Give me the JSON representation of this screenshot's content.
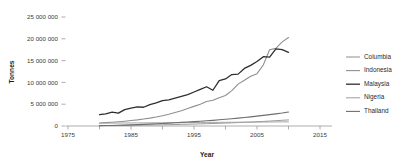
{
  "chart_data": {
    "type": "line",
    "title": "",
    "xlabel": "Year",
    "ylabel": "Tonnes",
    "xlim": [
      1975,
      2015
    ],
    "ylim": [
      0,
      25000000
    ],
    "grid": false,
    "legend_position": "right",
    "x_ticks": [
      "1975",
      "1980",
      "1985",
      "1990",
      "1995",
      "2000",
      "2005",
      "2010",
      "2015"
    ],
    "x_tick_values": [
      1975,
      1980,
      1985,
      1990,
      1995,
      2000,
      2005,
      2010,
      2015
    ],
    "x_tick_labels_shown": [
      "1975",
      "1980",
      "1985",
      "1990",
      "1995",
      "2000",
      "2005",
      "2010",
      "2015"
    ],
    "y_ticks": [
      "0",
      "5 000 000",
      "10 000 000",
      "15 000 000",
      "20 000 000",
      "25 000 000"
    ],
    "y_tick_values": [
      0,
      5000000,
      10000000,
      15000000,
      20000000,
      25000000
    ],
    "x": [
      1980,
      1981,
      1982,
      1983,
      1984,
      1985,
      1986,
      1987,
      1988,
      1989,
      1990,
      1991,
      1992,
      1993,
      1994,
      1995,
      1996,
      1997,
      1998,
      1999,
      2000,
      2001,
      2002,
      2003,
      2004,
      2005,
      2006,
      2007,
      2008,
      2009,
      2010
    ],
    "series": [
      {
        "name": "Columbia",
        "color": "#9a9a9a",
        "width": 1.0,
        "values": [
          100000,
          110000,
          125000,
          140000,
          155000,
          170000,
          190000,
          210000,
          230000,
          255000,
          280000,
          310000,
          340000,
          375000,
          410000,
          450000,
          490000,
          530000,
          570000,
          620000,
          670000,
          720000,
          780000,
          840000,
          900000,
          970000,
          1050000,
          1130000,
          1220000,
          1310000,
          1400000
        ]
      },
      {
        "name": "Indonesia",
        "color": "#8f8f8f",
        "width": 1.1,
        "values": [
          700000,
          780000,
          870000,
          980000,
          1100000,
          1250000,
          1400000,
          1600000,
          1800000,
          2050000,
          2350000,
          2700000,
          3100000,
          3500000,
          4000000,
          4500000,
          5000000,
          5600000,
          5900000,
          6500000,
          7000000,
          8100000,
          9600000,
          10500000,
          11400000,
          12000000,
          14000000,
          17500000,
          17800000,
          19300000,
          20300000
        ]
      },
      {
        "name": "Malaysia",
        "color": "#2e2e2e",
        "width": 1.3,
        "values": [
          2600000,
          2800000,
          3200000,
          2950000,
          3750000,
          4100000,
          4400000,
          4300000,
          4900000,
          5300000,
          5800000,
          6000000,
          6400000,
          6800000,
          7200000,
          7800000,
          8400000,
          9000000,
          8200000,
          10400000,
          10800000,
          11800000,
          11900000,
          13200000,
          13900000,
          14800000,
          15900000,
          15800000,
          17700000,
          17500000,
          16900000
        ]
      },
      {
        "name": "Nigeria",
        "color": "#a5a5a5",
        "width": 1.0,
        "values": [
          650000,
          660000,
          670000,
          680000,
          690000,
          700000,
          710000,
          720000,
          730000,
          740000,
          750000,
          760000,
          770000,
          780000,
          790000,
          800000,
          810000,
          820000,
          830000,
          840000,
          850000,
          860000,
          870000,
          880000,
          890000,
          900000,
          910000,
          920000,
          930000,
          940000,
          950000
        ]
      },
      {
        "name": "Thailand",
        "color": "#6e6e6e",
        "width": 1.1,
        "values": [
          80000,
          100000,
          130000,
          170000,
          210000,
          260000,
          310000,
          370000,
          430000,
          500000,
          570000,
          650000,
          730000,
          820000,
          910000,
          1000000,
          1100000,
          1200000,
          1300000,
          1420000,
          1540000,
          1670000,
          1800000,
          1950000,
          2100000,
          2260000,
          2430000,
          2600000,
          2780000,
          2970000,
          3200000
        ]
      }
    ]
  },
  "legend": {
    "entries": [
      {
        "label": "Columbia"
      },
      {
        "label": "Indonesia"
      },
      {
        "label": "Malaysia"
      },
      {
        "label": "Nigeria"
      },
      {
        "label": "Thailand"
      }
    ]
  }
}
